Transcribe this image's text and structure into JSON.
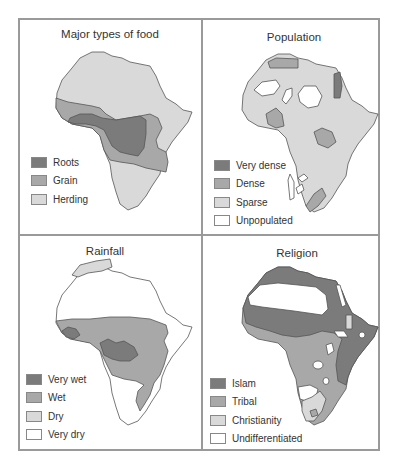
{
  "panels": {
    "food": {
      "title": "Major types of food",
      "legend": [
        {
          "label": "Roots",
          "color": "#7b7b7b"
        },
        {
          "label": "Grain",
          "color": "#a8a8a8"
        },
        {
          "label": "Herding",
          "color": "#d9d9d9"
        }
      ]
    },
    "population": {
      "title": "Population",
      "legend": [
        {
          "label": "Very dense",
          "color": "#7b7b7b"
        },
        {
          "label": "Dense",
          "color": "#a8a8a8"
        },
        {
          "label": "Sparse",
          "color": "#d9d9d9"
        },
        {
          "label": "Unpopulated",
          "color": "#ffffff"
        }
      ]
    },
    "rainfall": {
      "title": "Rainfall",
      "legend": [
        {
          "label": "Very wet",
          "color": "#7b7b7b"
        },
        {
          "label": "Wet",
          "color": "#a8a8a8"
        },
        {
          "label": "Dry",
          "color": "#d9d9d9"
        },
        {
          "label": "Very dry",
          "color": "#ffffff"
        }
      ]
    },
    "religion": {
      "title": "Religion",
      "legend": [
        {
          "label": "Islam",
          "color": "#7b7b7b"
        },
        {
          "label": "Tribal",
          "color": "#a8a8a8"
        },
        {
          "label": "Christianity",
          "color": "#d9d9d9"
        },
        {
          "label": "Undifferentiated",
          "color": "#ffffff"
        }
      ]
    }
  }
}
